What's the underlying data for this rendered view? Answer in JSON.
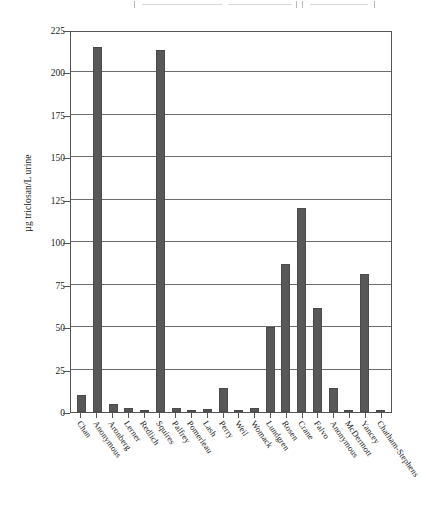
{
  "chart_data": {
    "type": "bar",
    "title": "",
    "xlabel": "",
    "ylabel": "µg triclosan/L urine",
    "ylim": [
      0,
      225
    ],
    "ytick_step": 25,
    "yticks": [
      0,
      25,
      50,
      75,
      100,
      125,
      150,
      175,
      200,
      225
    ],
    "grid": true,
    "legend": "none",
    "bar_color": "#585858",
    "categories": [
      "Chan",
      "Anonymous",
      "Aronberg",
      "Lerner",
      "Redlich",
      "Squires",
      "Palfrey",
      "Pomerleau",
      "Lash",
      "Perry",
      "Weil",
      "Womack",
      "Lundgren",
      "Rosen",
      "Crane",
      "Falvo",
      "Anonymous",
      "McDermott",
      "Yancey",
      "Chatham-Stephens"
    ],
    "values": [
      10,
      215,
      5,
      2.5,
      0.5,
      213,
      2.5,
      0.3,
      1.5,
      14,
      0.5,
      2.5,
      50,
      87,
      120,
      61,
      14,
      0.3,
      81,
      0.3
    ]
  }
}
